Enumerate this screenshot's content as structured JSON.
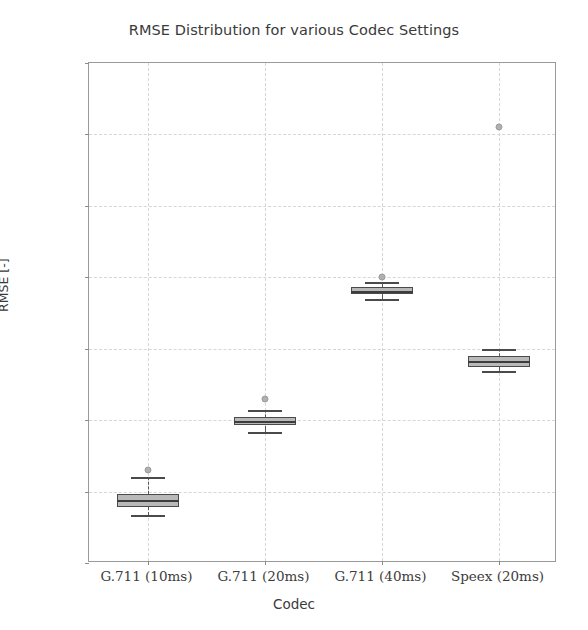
{
  "chart_data": {
    "type": "box",
    "title": "RMSE Distribution for various Codec Settings",
    "xlabel": "Codec",
    "ylabel": "RMSE [-]",
    "categories": [
      "G.711 (10ms)",
      "G.711 (20ms)",
      "G.711 (40ms)",
      "Speex (20ms)"
    ],
    "ylim": [
      0.16,
      0.3
    ],
    "yticks": [
      "0.16",
      "0.18",
      "0.20",
      "0.22",
      "0.24",
      "0.26",
      "0.28",
      "0.30"
    ],
    "ytick_values": [
      0.16,
      0.18,
      0.2,
      0.22,
      0.24,
      0.26,
      0.28,
      0.3
    ],
    "grid": true,
    "legend": "none",
    "boxes": [
      {
        "category": "G.711 (10ms)",
        "whisker_low": 0.1735,
        "q1": 0.1758,
        "median": 0.1776,
        "q3": 0.1792,
        "whisker_high": 0.184,
        "outliers": [
          0.186
        ]
      },
      {
        "category": "G.711 (20ms)",
        "whisker_low": 0.1968,
        "q1": 0.1985,
        "median": 0.1998,
        "q3": 0.201,
        "whisker_high": 0.2028,
        "outliers": [
          0.206
        ]
      },
      {
        "category": "G.711 (40ms)",
        "whisker_low": 0.234,
        "q1": 0.2352,
        "median": 0.2362,
        "q3": 0.2372,
        "whisker_high": 0.2388,
        "outliers": [
          0.24
        ]
      },
      {
        "category": "Speex (20ms)",
        "whisker_low": 0.2138,
        "q1": 0.215,
        "median": 0.2165,
        "q3": 0.218,
        "whisker_high": 0.22,
        "outliers": [
          0.282
        ]
      }
    ]
  },
  "colors": {
    "box_fill": "#b9b9b9",
    "box_edge": "#4a4a4a",
    "median": "#3d3d3d",
    "outlier": "#b0b0b0",
    "grid": "#d6d6d6",
    "frame": "#9a9a9a",
    "text": "#3a3a3a"
  }
}
